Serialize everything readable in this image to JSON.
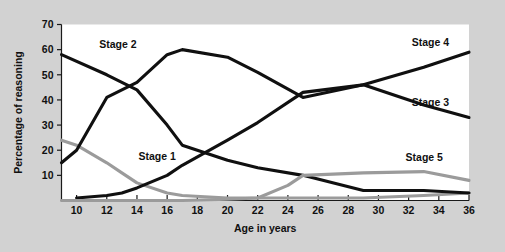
{
  "chart_data": {
    "type": "line",
    "title": "",
    "xlabel": "Age in years",
    "ylabel": "Percentage of reasoning",
    "xlim": [
      9,
      36
    ],
    "ylim": [
      0,
      70
    ],
    "grid": false,
    "legend": "inline-labels",
    "xticks": [
      10,
      12,
      14,
      16,
      18,
      20,
      22,
      24,
      26,
      28,
      30,
      32,
      34,
      36
    ],
    "yticks": [
      10,
      20,
      30,
      40,
      50,
      60,
      70
    ],
    "xtick_labels": [
      "10",
      "12",
      "14",
      "16",
      "18",
      "20",
      "22",
      "24",
      "26",
      "28",
      "30",
      "32",
      "34",
      "36"
    ],
    "ytick_labels": [
      "10",
      "20",
      "30",
      "40",
      "50",
      "60",
      "70"
    ],
    "series": [
      {
        "name": "Stage 1",
        "color": "#9b9b9b",
        "style": "gray",
        "label_x": 14.1,
        "label_y": 17.5,
        "x": [
          9,
          10,
          12,
          13,
          14,
          16,
          17,
          20,
          22,
          25,
          29,
          33,
          36
        ],
        "values": [
          24,
          22,
          15,
          11,
          7,
          3,
          2,
          1,
          1,
          1,
          1,
          2,
          3
        ]
      },
      {
        "name": "Stage 2",
        "color": "#101010",
        "style": "black",
        "label_x": 11.5,
        "label_y": 62,
        "x": [
          9,
          12,
          13,
          14,
          16,
          17,
          20,
          22,
          25,
          29,
          33,
          36
        ],
        "values": [
          58,
          50,
          47,
          44,
          30,
          22,
          16,
          13,
          10,
          4,
          4,
          3
        ]
      },
      {
        "name": "Stage 3",
        "color": "#101010",
        "style": "black",
        "label_x": 32.2,
        "label_y": 39,
        "x": [
          9,
          10,
          12,
          14,
          16,
          17,
          20,
          22,
          25,
          29,
          33,
          36
        ],
        "values": [
          15,
          20,
          41,
          47,
          58,
          60,
          57,
          51,
          41,
          46,
          38,
          33
        ]
      },
      {
        "name": "Stage 4",
        "color": "#101010",
        "style": "black",
        "label_x": 32.2,
        "label_y": 63,
        "x": [
          10,
          12,
          13,
          14,
          16,
          17,
          20,
          22,
          25,
          29,
          33,
          36
        ],
        "values": [
          1,
          2,
          3,
          5,
          10,
          14,
          24,
          31,
          43,
          46,
          53,
          59
        ]
      },
      {
        "name": "Stage 5",
        "color": "#9b9b9b",
        "style": "gray",
        "label_x": 31.8,
        "label_y": 17,
        "x": [
          9,
          17,
          20,
          22,
          24,
          25,
          29,
          33,
          36
        ],
        "values": [
          0,
          0,
          0.5,
          1,
          6,
          10,
          11,
          11.5,
          8
        ]
      }
    ]
  }
}
